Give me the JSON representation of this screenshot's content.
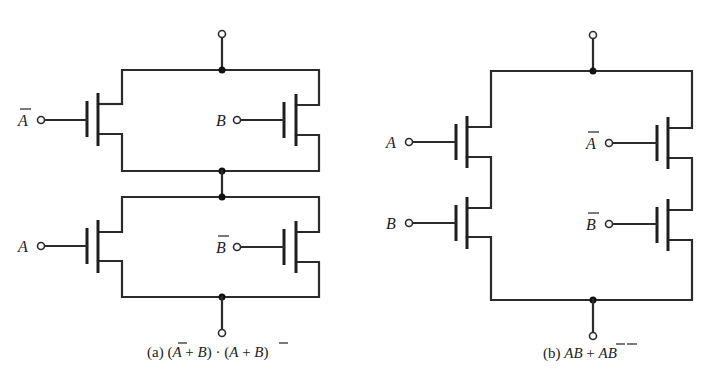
{
  "figure": {
    "circuit_a": {
      "caption_prefix": "(a)",
      "caption_expr": "(Ā + B) · (A + B̄)",
      "inputs": [
        {
          "label": "A",
          "overbar": true,
          "position": "top-left"
        },
        {
          "label": "B",
          "overbar": false,
          "position": "top-right"
        },
        {
          "label": "A",
          "overbar": false,
          "position": "bottom-left"
        },
        {
          "label": "B",
          "overbar": true,
          "position": "bottom-right"
        }
      ],
      "topology": "two parallel pairs connected in series"
    },
    "circuit_b": {
      "caption_prefix": "(b)",
      "caption_expr": "AB + ĀB̄",
      "inputs": [
        {
          "label": "A",
          "overbar": false,
          "position": "left-upper"
        },
        {
          "label": "B",
          "overbar": false,
          "position": "left-lower"
        },
        {
          "label": "A",
          "overbar": true,
          "position": "right-upper"
        },
        {
          "label": "B",
          "overbar": true,
          "position": "right-lower"
        }
      ],
      "topology": "two series pairs connected in parallel"
    }
  },
  "labels": {
    "a_top_left": "A",
    "a_top_right": "B",
    "a_bot_left": "A",
    "a_bot_right": "B",
    "b_left_up": "A",
    "b_left_low": "B",
    "b_right_up": "A",
    "b_right_low": "B",
    "a_cap_prefix": "(a) (",
    "a_cap_A1": "A",
    "a_cap_plus1": " + ",
    "a_cap_B1": "B",
    "a_cap_mid": ") · (",
    "a_cap_A2": "A",
    "a_cap_plus2": " + ",
    "a_cap_B2": "B",
    "a_cap_end": ")",
    "b_cap_prefix": "(b) ",
    "b_cap_AB": "AB",
    "b_cap_plus": " + ",
    "b_cap_A": "A",
    "b_cap_B": "B"
  }
}
